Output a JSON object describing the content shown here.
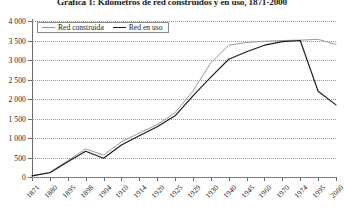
{
  "chart_data": {
    "type": "line",
    "title": "Gráfica 1: Kilómetros de red construidos y en uso, 1871-2000",
    "xlabel": "",
    "ylabel": "",
    "ylim": [
      0,
      4000
    ],
    "ytick_step": 500,
    "grid": true,
    "legend_position": "top-left",
    "categories": [
      "1871",
      "1880",
      "1895",
      "1898",
      "1904",
      "1910",
      "1914",
      "1920",
      "1925",
      "1929",
      "1930",
      "1940",
      "1945",
      "1960",
      "1970",
      "1974",
      "1995",
      "2000"
    ],
    "yticks": [
      "4 000",
      "3 500",
      "3 000",
      "2 500",
      "2 000",
      "1 500",
      "1 000",
      "500",
      "0"
    ],
    "ytick_values": [
      4000,
      3500,
      3000,
      2500,
      2000,
      1500,
      1000,
      500,
      0
    ],
    "series": [
      {
        "name": "Red construida",
        "color": "#9a9a9a",
        "values": [
          30,
          120,
          420,
          720,
          560,
          900,
          1130,
          1340,
          1650,
          2200,
          2930,
          3380,
          3450,
          3480,
          3500,
          3510,
          3530,
          3400
        ]
      },
      {
        "name": "Red en uso",
        "color": "#1a1a1a",
        "values": [
          30,
          110,
          390,
          660,
          480,
          820,
          1060,
          1290,
          1570,
          2080,
          2560,
          3020,
          3210,
          3380,
          3470,
          3500,
          2200,
          1850
        ]
      }
    ]
  },
  "legend": {
    "entries": [
      {
        "label": "Red construida",
        "icon": "line-swatch-gray"
      },
      {
        "label": "Red en uso",
        "icon": "line-swatch-black"
      }
    ]
  }
}
